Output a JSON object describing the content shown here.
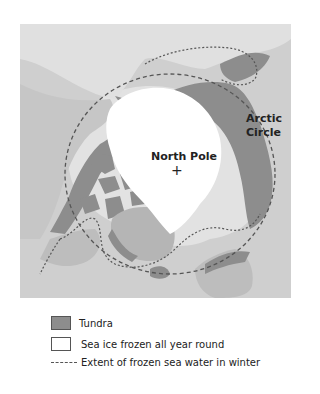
{
  "map": {
    "labels": {
      "north_pole": "North Pole",
      "arctic_circle_line1": "Arctic",
      "arctic_circle_line2": "Circle"
    },
    "pole_marker": "+",
    "colors": {
      "ocean": "#cfcfcf",
      "land": "#b5b5b5",
      "tundra": "#8d8d8d",
      "sea_ice": "#ffffff",
      "winter_ice": "#e2e2e2",
      "dashed_line": "#555555"
    }
  },
  "legend": {
    "items": [
      {
        "label": "Tundra",
        "type": "swatch-tundra"
      },
      {
        "label": "Sea ice frozen all year round",
        "type": "swatch-ice"
      },
      {
        "label": "Extent of frozen sea water in winter",
        "type": "dashed-line"
      }
    ]
  }
}
